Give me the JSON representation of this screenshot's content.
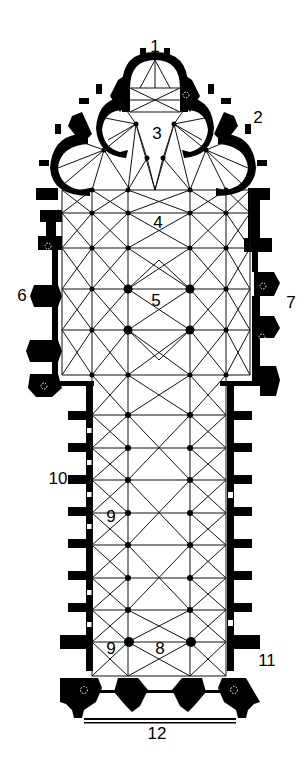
{
  "diagram": {
    "type": "architectural-floor-plan",
    "colors": {
      "wall": "#000000",
      "background": "#ffffff",
      "rib": "#111111"
    },
    "labels": [
      {
        "id": "1",
        "text": "1",
        "x": 155,
        "y": 46
      },
      {
        "id": "2",
        "text": "2",
        "x": 258,
        "y": 117
      },
      {
        "id": "3",
        "text": "3",
        "x": 157,
        "y": 133
      },
      {
        "id": "4",
        "text": "4",
        "x": 158,
        "y": 222
      },
      {
        "id": "5",
        "text": "5",
        "x": 156,
        "y": 300
      },
      {
        "id": "6",
        "text": "6",
        "x": 22,
        "y": 295
      },
      {
        "id": "7",
        "text": "7",
        "x": 291,
        "y": 302
      },
      {
        "id": "10",
        "text": "10",
        "x": 58,
        "y": 478
      },
      {
        "id": "9a",
        "text": "9",
        "x": 111,
        "y": 516
      },
      {
        "id": "9b",
        "text": "9",
        "x": 111,
        "y": 648
      },
      {
        "id": "8",
        "text": "8",
        "x": 160,
        "y": 648
      },
      {
        "id": "11",
        "text": "11",
        "x": 267,
        "y": 660
      },
      {
        "id": "12",
        "text": "12",
        "x": 157,
        "y": 733
      }
    ]
  }
}
